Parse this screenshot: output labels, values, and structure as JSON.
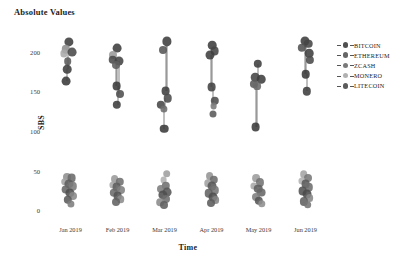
{
  "chart_title": "Absolute Values",
  "axes": {
    "y_label": "SBS",
    "x_label": "Time",
    "y_ticks": [
      "0",
      "50",
      "100",
      "150",
      "200"
    ],
    "x_ticks": [
      "Jan 2019",
      "Feb 2019",
      "Mar 2019",
      "Apr 2019",
      "May 2019",
      "Jun 2019"
    ]
  },
  "legend": {
    "position": "right",
    "items": [
      {
        "label": "BITCOIN",
        "color": "#3d3d3d",
        "icon": "legend-marker-icon"
      },
      {
        "label": "ETHEREUM",
        "color": "#555555",
        "icon": "legend-marker-icon"
      },
      {
        "label": "ZCASH",
        "color": "#6b6b6b",
        "icon": "legend-marker-icon"
      },
      {
        "label": "MONERO",
        "color": "#a8a8a8",
        "icon": "legend-marker-icon"
      },
      {
        "label": "LITECOIN",
        "color": "#4a4a4a",
        "icon": "legend-marker-icon"
      }
    ]
  },
  "chart_data": {
    "type": "scatter",
    "title": "Absolute Values",
    "xlabel": "Time",
    "ylabel": "SBS",
    "xlim": [
      0,
      7
    ],
    "ylim": [
      -10,
      225
    ],
    "grid": false,
    "legend_position": "right",
    "categories": [
      "Jan 2019",
      "Feb 2019",
      "Mar 2019",
      "Apr 2019",
      "May 2019",
      "Jun 2019"
    ],
    "series": [
      {
        "name": "BITCOIN",
        "color": "#3d3d3d",
        "values": [
          212,
          205,
          213,
          208,
          185,
          214
        ]
      },
      {
        "name": "ETHEREUM",
        "color": "#555555",
        "values": [
          198,
          190,
          150,
          196,
          168,
          205
        ]
      },
      {
        "name": "ZCASH",
        "color": "#6b6b6b",
        "values": [
          178,
          175,
          145,
          155,
          165,
          190
        ]
      },
      {
        "name": "MONERO",
        "color": "#a8a8a8",
        "values": [
          203,
          196,
          196,
          201,
          172,
          198
        ]
      },
      {
        "name": "LITECOIN",
        "color": "#4a4a4a",
        "values": [
          163,
          148,
          103,
          140,
          105,
          172
        ]
      }
    ],
    "low_band_series": [
      {
        "name": "BITCOIN",
        "color": "#3d3d3d",
        "values": [
          30,
          27,
          26,
          32,
          24,
          34
        ]
      },
      {
        "name": "ETHEREUM",
        "color": "#555555",
        "values": [
          24,
          21,
          20,
          25,
          19,
          27
        ]
      },
      {
        "name": "ZCASH",
        "color": "#6b6b6b",
        "values": [
          18,
          16,
          15,
          19,
          14,
          21
        ]
      },
      {
        "name": "MONERO",
        "color": "#a8a8a8",
        "values": [
          36,
          33,
          32,
          38,
          29,
          40
        ]
      },
      {
        "name": "LITECOIN",
        "color": "#4a4a4a",
        "values": [
          12,
          10,
          9,
          13,
          9,
          15
        ]
      }
    ],
    "points": [
      {
        "m": 0,
        "ox": -1.5,
        "y": 212,
        "r": 4.6,
        "c": "#3d3d3d"
      },
      {
        "m": 0,
        "ox": -5.0,
        "y": 203,
        "r": 4.2,
        "c": "#8d8d8d"
      },
      {
        "m": 0,
        "ox": -6.2,
        "y": 198,
        "r": 3.6,
        "c": "#aaaaaa"
      },
      {
        "m": 0,
        "ox": 1.5,
        "y": 200,
        "r": 4.4,
        "c": "#4a4a4a"
      },
      {
        "m": 0,
        "ox": -3.0,
        "y": 188,
        "r": 3.8,
        "c": "#5a5a5a"
      },
      {
        "m": 0,
        "ox": -3.2,
        "y": 178,
        "r": 4.3,
        "c": "#3f3f3f"
      },
      {
        "m": 0,
        "ox": -4.5,
        "y": 163,
        "r": 4.4,
        "c": "#3a3a3a"
      },
      {
        "m": 1,
        "ox": -0.5,
        "y": 205,
        "r": 4.4,
        "c": "#3d3d3d"
      },
      {
        "m": 1,
        "ox": -4.5,
        "y": 196,
        "r": 4.0,
        "c": "#9a9a9a"
      },
      {
        "m": 1,
        "ox": -5.0,
        "y": 190,
        "r": 4.3,
        "c": "#4a4a4a"
      },
      {
        "m": 1,
        "ox": 1.5,
        "y": 188,
        "r": 4.5,
        "c": "#434343"
      },
      {
        "m": 1,
        "ox": -2.0,
        "y": 183,
        "r": 4.0,
        "c": "#5f5f5f"
      },
      {
        "m": 1,
        "ox": -1.0,
        "y": 157,
        "r": 4.4,
        "c": "#3a3a3a"
      },
      {
        "m": 1,
        "ox": 2.5,
        "y": 147,
        "r": 4.0,
        "c": "#4f4f4f"
      },
      {
        "m": 1,
        "ox": -1.0,
        "y": 133,
        "r": 4.2,
        "c": "#3d3d3d"
      },
      {
        "m": 2,
        "ox": 2.0,
        "y": 213,
        "r": 4.6,
        "c": "#3d3d3d"
      },
      {
        "m": 2,
        "ox": -2.0,
        "y": 202,
        "r": 4.0,
        "c": "#555555"
      },
      {
        "m": 2,
        "ox": 1.0,
        "y": 150,
        "r": 4.4,
        "c": "#3f3f3f"
      },
      {
        "m": 2,
        "ox": 3.0,
        "y": 141,
        "r": 4.3,
        "c": "#4a4a4a"
      },
      {
        "m": 2,
        "ox": -3.5,
        "y": 133,
        "r": 4.2,
        "c": "#474747"
      },
      {
        "m": 2,
        "ox": -1.0,
        "y": 128,
        "r": 3.6,
        "c": "#6d6d6d"
      },
      {
        "m": 2,
        "ox": -0.5,
        "y": 103,
        "r": 4.3,
        "c": "#3a3a3a"
      },
      {
        "m": 3,
        "ox": 0.5,
        "y": 208,
        "r": 4.3,
        "c": "#3d3d3d"
      },
      {
        "m": 3,
        "ox": 3.0,
        "y": 201,
        "r": 4.4,
        "c": "#464646"
      },
      {
        "m": 3,
        "ox": -2.0,
        "y": 196,
        "r": 4.5,
        "c": "#3f3f3f"
      },
      {
        "m": 3,
        "ox": 0.0,
        "y": 155,
        "r": 4.4,
        "c": "#424242"
      },
      {
        "m": 3,
        "ox": 3.0,
        "y": 138,
        "r": 4.2,
        "c": "#4d4d4d"
      },
      {
        "m": 3,
        "ox": 2.0,
        "y": 131,
        "r": 3.4,
        "c": "#7a7a7a"
      },
      {
        "m": 3,
        "ox": 1.0,
        "y": 122,
        "r": 3.5,
        "c": "#5a5a5a"
      },
      {
        "m": 4,
        "ox": -0.5,
        "y": 185,
        "r": 4.2,
        "c": "#3d3d3d"
      },
      {
        "m": 4,
        "ox": -3.5,
        "y": 168,
        "r": 4.3,
        "c": "#444444"
      },
      {
        "m": 4,
        "ox": 2.5,
        "y": 165,
        "r": 4.3,
        "c": "#3f3f3f"
      },
      {
        "m": 4,
        "ox": -5.0,
        "y": 159,
        "r": 4.1,
        "c": "#5a5a5a"
      },
      {
        "m": 4,
        "ox": -1.5,
        "y": 157,
        "r": 3.9,
        "c": "#6a6a6a"
      },
      {
        "m": 4,
        "ox": -3.0,
        "y": 105,
        "r": 4.4,
        "c": "#3a3a3a"
      },
      {
        "m": 5,
        "ox": -1.0,
        "y": 214,
        "r": 4.5,
        "c": "#3d3d3d"
      },
      {
        "m": 5,
        "ox": 2.5,
        "y": 210,
        "r": 4.3,
        "c": "#454545"
      },
      {
        "m": 5,
        "ox": -3.5,
        "y": 205,
        "r": 4.2,
        "c": "#525252"
      },
      {
        "m": 5,
        "ox": 3.5,
        "y": 198,
        "r": 4.3,
        "c": "#3f3f3f"
      },
      {
        "m": 5,
        "ox": 4.0,
        "y": 190,
        "r": 4.1,
        "c": "#4a4a4a"
      },
      {
        "m": 5,
        "ox": 0.0,
        "y": 172,
        "r": 4.3,
        "c": "#3a3a3a"
      },
      {
        "m": 5,
        "ox": 1.5,
        "y": 150,
        "r": 4.2,
        "c": "#3d3d3d"
      },
      {
        "m": 0,
        "ox": -4.0,
        "y": 42,
        "r": 4.0,
        "c": "#8e8e8e"
      },
      {
        "m": 0,
        "ox": 1.0,
        "y": 40,
        "r": 4.4,
        "c": "#6a6a6a"
      },
      {
        "m": 0,
        "ox": -6.0,
        "y": 36,
        "r": 3.8,
        "c": "#a2a2a2"
      },
      {
        "m": 0,
        "ox": -2.0,
        "y": 33,
        "r": 4.6,
        "c": "#5d5d5d"
      },
      {
        "m": 0,
        "ox": 2.0,
        "y": 30,
        "r": 4.2,
        "c": "#7b7b7b"
      },
      {
        "m": 0,
        "ox": -5.0,
        "y": 26,
        "r": 4.4,
        "c": "#666666"
      },
      {
        "m": 0,
        "ox": -1.0,
        "y": 22,
        "r": 4.6,
        "c": "#4f4f4f"
      },
      {
        "m": 0,
        "ox": 2.5,
        "y": 18,
        "r": 4.0,
        "c": "#888888"
      },
      {
        "m": 0,
        "ox": -3.0,
        "y": 13,
        "r": 4.2,
        "c": "#5a5a5a"
      },
      {
        "m": 0,
        "ox": 0.5,
        "y": 8,
        "r": 3.6,
        "c": "#7d7d7d"
      },
      {
        "m": 1,
        "ox": -3.0,
        "y": 39,
        "r": 3.9,
        "c": "#9a9a9a"
      },
      {
        "m": 1,
        "ox": 2.0,
        "y": 36,
        "r": 4.2,
        "c": "#6f6f6f"
      },
      {
        "m": 1,
        "ox": -5.0,
        "y": 32,
        "r": 3.6,
        "c": "#a6a6a6"
      },
      {
        "m": 1,
        "ox": -1.0,
        "y": 29,
        "r": 4.4,
        "c": "#5d5d5d"
      },
      {
        "m": 1,
        "ox": 3.0,
        "y": 26,
        "r": 4.0,
        "c": "#808080"
      },
      {
        "m": 1,
        "ox": -4.0,
        "y": 22,
        "r": 4.2,
        "c": "#6b6b6b"
      },
      {
        "m": 1,
        "ox": 0.0,
        "y": 18,
        "r": 4.4,
        "c": "#545454"
      },
      {
        "m": 1,
        "ox": 3.0,
        "y": 14,
        "r": 3.8,
        "c": "#8c8c8c"
      },
      {
        "m": 1,
        "ox": -2.0,
        "y": 10,
        "r": 4.0,
        "c": "#626262"
      },
      {
        "m": 2,
        "ox": 2.0,
        "y": 46,
        "r": 3.8,
        "c": "#9e9e9e"
      },
      {
        "m": 2,
        "ox": -1.0,
        "y": 38,
        "r": 3.4,
        "c": "#b0b0b0"
      },
      {
        "m": 2,
        "ox": 1.0,
        "y": 31,
        "r": 4.2,
        "c": "#707070"
      },
      {
        "m": 2,
        "ox": -4.0,
        "y": 27,
        "r": 4.0,
        "c": "#7d7d7d"
      },
      {
        "m": 2,
        "ox": 2.5,
        "y": 23,
        "r": 4.4,
        "c": "#565656"
      },
      {
        "m": 2,
        "ox": -2.0,
        "y": 19,
        "r": 4.6,
        "c": "#4e4e4e"
      },
      {
        "m": 2,
        "ox": 1.0,
        "y": 14,
        "r": 4.0,
        "c": "#6e6e6e"
      },
      {
        "m": 2,
        "ox": -4.5,
        "y": 10,
        "r": 3.8,
        "c": "#8a8a8a"
      },
      {
        "m": 2,
        "ox": -0.5,
        "y": 7,
        "r": 4.0,
        "c": "#5f5f5f"
      },
      {
        "m": 3,
        "ox": -2.0,
        "y": 43,
        "r": 3.9,
        "c": "#949494"
      },
      {
        "m": 3,
        "ox": 2.5,
        "y": 38,
        "r": 4.2,
        "c": "#6c6c6c"
      },
      {
        "m": 3,
        "ox": -4.0,
        "y": 34,
        "r": 3.7,
        "c": "#a0a0a0"
      },
      {
        "m": 3,
        "ox": 0.5,
        "y": 30,
        "r": 4.5,
        "c": "#585858"
      },
      {
        "m": 3,
        "ox": 3.5,
        "y": 25,
        "r": 4.2,
        "c": "#757575"
      },
      {
        "m": 3,
        "ox": -3.0,
        "y": 21,
        "r": 4.3,
        "c": "#636363"
      },
      {
        "m": 3,
        "ox": 1.0,
        "y": 17,
        "r": 4.5,
        "c": "#4d4d4d"
      },
      {
        "m": 3,
        "ox": 4.0,
        "y": 13,
        "r": 3.9,
        "c": "#848484"
      },
      {
        "m": 3,
        "ox": -1.0,
        "y": 9,
        "r": 4.0,
        "c": "#5c5c5c"
      },
      {
        "m": 4,
        "ox": -2.5,
        "y": 40,
        "r": 3.9,
        "c": "#9c9c9c"
      },
      {
        "m": 4,
        "ox": 1.5,
        "y": 35,
        "r": 4.1,
        "c": "#737373"
      },
      {
        "m": 4,
        "ox": -4.5,
        "y": 31,
        "r": 3.6,
        "c": "#a9a9a9"
      },
      {
        "m": 4,
        "ox": -0.5,
        "y": 27,
        "r": 4.3,
        "c": "#5e5e5e"
      },
      {
        "m": 4,
        "ox": 2.5,
        "y": 22,
        "r": 4.4,
        "c": "#666666"
      },
      {
        "m": 4,
        "ox": -3.0,
        "y": 17,
        "r": 4.0,
        "c": "#7e7e7e"
      },
      {
        "m": 4,
        "ox": 0.5,
        "y": 12,
        "r": 4.2,
        "c": "#555555"
      },
      {
        "m": 4,
        "ox": 3.0,
        "y": 8,
        "r": 3.7,
        "c": "#8e8e8e"
      },
      {
        "m": 5,
        "ox": -2.0,
        "y": 45,
        "r": 3.8,
        "c": "#a4a4a4"
      },
      {
        "m": 5,
        "ox": 2.0,
        "y": 41,
        "r": 4.0,
        "c": "#787878"
      },
      {
        "m": 5,
        "ox": -4.0,
        "y": 37,
        "r": 3.6,
        "c": "#b2b2b2"
      },
      {
        "m": 5,
        "ox": 0.0,
        "y": 33,
        "r": 4.4,
        "c": "#5a5a5a"
      },
      {
        "m": 5,
        "ox": 3.5,
        "y": 29,
        "r": 4.2,
        "c": "#6d6d6d"
      },
      {
        "m": 5,
        "ox": -3.0,
        "y": 24,
        "r": 4.4,
        "c": "#525252"
      },
      {
        "m": 5,
        "ox": 1.0,
        "y": 20,
        "r": 4.5,
        "c": "#4a4a4a"
      },
      {
        "m": 5,
        "ox": 4.0,
        "y": 15,
        "r": 3.9,
        "c": "#868686"
      },
      {
        "m": 5,
        "ox": -1.5,
        "y": 11,
        "r": 4.1,
        "c": "#606060"
      },
      {
        "m": 5,
        "ox": 2.0,
        "y": 7,
        "r": 3.8,
        "c": "#747474"
      }
    ],
    "connectors": [
      {
        "m": 0,
        "ox": -3.0,
        "y1": 198,
        "y2": 178
      },
      {
        "m": 0,
        "ox": -4.0,
        "y1": 178,
        "y2": 163
      },
      {
        "m": 1,
        "ox": -2.0,
        "y1": 190,
        "y2": 157
      },
      {
        "m": 1,
        "ox": -0.5,
        "y1": 190,
        "y2": 157
      },
      {
        "m": 1,
        "ox": 1.5,
        "y1": 188,
        "y2": 147
      },
      {
        "m": 1,
        "ox": 0.0,
        "y1": 157,
        "y2": 133
      },
      {
        "m": 2,
        "ox": 1.5,
        "y1": 207,
        "y2": 150
      },
      {
        "m": 2,
        "ox": 2.5,
        "y1": 207,
        "y2": 150
      },
      {
        "m": 2,
        "ox": -1.0,
        "y1": 133,
        "y2": 103
      },
      {
        "m": 2,
        "ox": 0.0,
        "y1": 141,
        "y2": 128
      },
      {
        "m": 3,
        "ox": -1.0,
        "y1": 196,
        "y2": 155
      },
      {
        "m": 3,
        "ox": 0.0,
        "y1": 196,
        "y2": 155
      },
      {
        "m": 3,
        "ox": 1.5,
        "y1": 155,
        "y2": 131
      },
      {
        "m": 4,
        "ox": -0.5,
        "y1": 185,
        "y2": 165
      },
      {
        "m": 4,
        "ox": -3.0,
        "y1": 159,
        "y2": 105
      },
      {
        "m": 4,
        "ox": -2.0,
        "y1": 159,
        "y2": 105
      },
      {
        "m": 5,
        "ox": -0.5,
        "y1": 210,
        "y2": 172
      },
      {
        "m": 5,
        "ox": 0.5,
        "y1": 210,
        "y2": 172
      },
      {
        "m": 5,
        "ox": 1.0,
        "y1": 172,
        "y2": 150
      }
    ]
  }
}
